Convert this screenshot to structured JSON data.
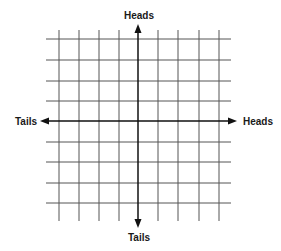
{
  "diagram": {
    "type": "coordinate-grid",
    "axes": {
      "top": "Heads",
      "bottom": "Tails",
      "left": "Tails",
      "right": "Heads"
    },
    "grid": {
      "columns": 10,
      "rows": 10,
      "vertical_lines_x": [
        59,
        79,
        99,
        119,
        158,
        178,
        199,
        219
      ],
      "horizontal_lines_y": [
        39,
        60,
        81,
        101,
        142,
        162,
        183,
        203
      ],
      "center": [
        138,
        121
      ],
      "line_color": "#555555",
      "axis_color": "#111111"
    }
  }
}
